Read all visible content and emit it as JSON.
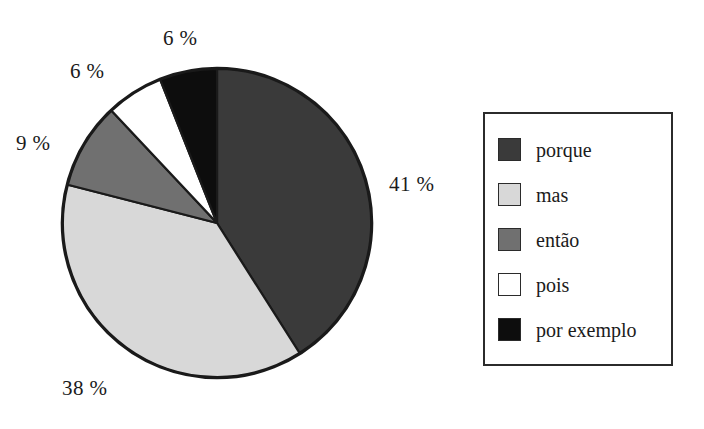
{
  "chart_data": {
    "type": "pie",
    "title": "",
    "subtitle": "",
    "xlabel": "",
    "ylabel": "",
    "grid": false,
    "legend_position": "right",
    "start_angle_deg": 0,
    "direction": "clockwise",
    "categories": [
      "porque",
      "mas",
      "então",
      "pois",
      "por exemplo"
    ],
    "values": [
      41,
      38,
      9,
      6,
      6
    ],
    "value_unit": "%",
    "data_labels": [
      "41 %",
      "38 %",
      "9 %",
      "6 %",
      "6 %"
    ],
    "colors": [
      "#3a3a3a",
      "#d8d8d8",
      "#707070",
      "#ffffff",
      "#0d0d0d"
    ],
    "slices": [
      {
        "label": "porque",
        "value": 41,
        "data_label": "41 %",
        "color": "#3a3a3a"
      },
      {
        "label": "mas",
        "value": 38,
        "data_label": "38 %",
        "color": "#d8d8d8"
      },
      {
        "label": "então",
        "value": 9,
        "data_label": "9 %",
        "color": "#707070"
      },
      {
        "label": "pois",
        "value": 6,
        "data_label": "6 %",
        "color": "#ffffff"
      },
      {
        "label": "por exemplo",
        "value": 6,
        "data_label": "6 %",
        "color": "#0d0d0d"
      }
    ]
  },
  "pie": {
    "outline_color": "#1a1a1a",
    "labels": {
      "porque": "41 %",
      "mas": "38 %",
      "entao": "9 %",
      "pois": "6 %",
      "por_exemplo": "6 %"
    }
  },
  "legend": {
    "border_color": "#2b2b2b",
    "background": "#ffffff",
    "items": [
      {
        "label": "porque",
        "color": "#3a3a3a"
      },
      {
        "label": "mas",
        "color": "#d8d8d8"
      },
      {
        "label": "então",
        "color": "#707070"
      },
      {
        "label": "pois",
        "color": "#ffffff"
      },
      {
        "label": "por exemplo",
        "color": "#0d0d0d"
      }
    ]
  }
}
